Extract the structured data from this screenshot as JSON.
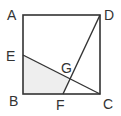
{
  "diagram": {
    "type": "geometry",
    "shape": "square",
    "points": {
      "A": {
        "label": "A",
        "x": 23,
        "y": 15
      },
      "D": {
        "label": "D",
        "x": 100,
        "y": 15
      },
      "B": {
        "label": "B",
        "x": 23,
        "y": 94
      },
      "C": {
        "label": "C",
        "x": 100,
        "y": 94
      },
      "E": {
        "label": "E",
        "x": 23,
        "y": 55
      },
      "F": {
        "label": "F",
        "x": 63,
        "y": 94
      },
      "G": {
        "label": "G",
        "x": 69,
        "y": 78
      }
    },
    "segments": [
      [
        "A",
        "D"
      ],
      [
        "D",
        "C"
      ],
      [
        "C",
        "B"
      ],
      [
        "B",
        "A"
      ],
      [
        "E",
        "C"
      ],
      [
        "D",
        "F"
      ]
    ],
    "shaded_region": [
      "E",
      "B",
      "F",
      "G"
    ],
    "colors": {
      "stroke": "#333333",
      "shade": "#eeeeee",
      "background": "#ffffff"
    }
  }
}
